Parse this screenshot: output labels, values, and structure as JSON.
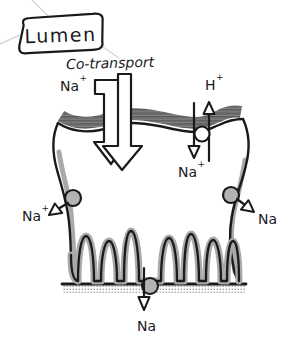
{
  "diagram_title": "Epithelial cell sodium transport",
  "colors": {
    "ink": "#1a1a1a",
    "shade": "#a9a9a9",
    "paper": "#ffffff"
  },
  "labels": {
    "lumen": "Lumen",
    "cotransport": "Co-transport",
    "na_cotransport": {
      "base": "Na",
      "sup": "+"
    },
    "h_antiport": {
      "base": "H",
      "sup": "+"
    },
    "na_antiport": {
      "base": "Na",
      "sup": "+"
    },
    "na_left": {
      "base": "Na",
      "sup": "+"
    },
    "na_right": {
      "base": "Na",
      "sup": ""
    },
    "na_bottom": {
      "base": "Na",
      "sup": ""
    }
  },
  "icons": [
    "cotransport-double-arrow-icon",
    "antiporter-circle-icon",
    "pump-circle-icon",
    "hollow-arrowhead-icon"
  ]
}
